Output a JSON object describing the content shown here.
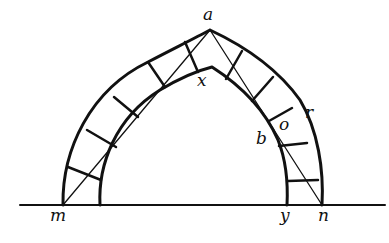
{
  "diagram": {
    "type": "pointed arch with voussoirs",
    "labels": {
      "a": "a",
      "x": "x",
      "b": "b",
      "o": "o",
      "r": "r",
      "m": "m",
      "y": "y",
      "n": "n"
    },
    "colors": {
      "line": "#111111",
      "background": "#ffffff"
    }
  }
}
